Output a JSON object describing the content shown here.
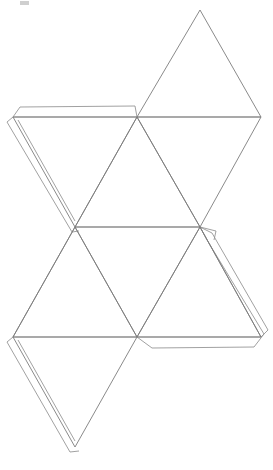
{
  "document": {
    "title": "Polyhedron Net",
    "kind": "geometric-net-diagram",
    "background_color": "#ffffff",
    "width": 273,
    "height": 470
  },
  "figure": {
    "name": "triangular-polyhedron-net",
    "line_color": "#7d7d7d",
    "fold_line_color": "#8d8d8d",
    "tab_line_color": "#909090",
    "face_fill_color": "#ffffff",
    "triangle_side_length": 124,
    "triangle_height": 110,
    "face_count": 8,
    "tab_count": 6
  },
  "geometry": {
    "vertices": {
      "apex_top": [
        200,
        10
      ],
      "band1_left": [
        13,
        117
      ],
      "band1_mid": [
        137,
        117
      ],
      "band1_right": [
        261,
        117
      ],
      "band2_left": [
        13,
        227
      ],
      "band2_mid": [
        75,
        227
      ],
      "band2_right": [
        200,
        227
      ],
      "band3_left": [
        13,
        337
      ],
      "band3_mid": [
        137,
        337
      ],
      "band3_right": [
        261,
        337
      ],
      "apex_bottom": [
        75,
        447
      ]
    },
    "faces": [
      {
        "name": "face-top-up",
        "points": "200,10 137,117 261,117",
        "orientation": "up"
      },
      {
        "name": "face-upper-left-down",
        "points": "13,117 137,117 75,227",
        "orientation": "down"
      },
      {
        "name": "face-upper-mid-down",
        "points": "137,117 261,117 200,227",
        "orientation": "down"
      },
      {
        "name": "face-mid-left-up",
        "points": "75,227 13,337 137,337",
        "orientation": "up"
      },
      {
        "name": "face-mid-right-up",
        "points": "200,227 137,337 261,337",
        "orientation": "up"
      },
      {
        "name": "face-mid-center-up",
        "points": "137,117 75,227 200,227",
        "orientation": "hidden"
      },
      {
        "name": "face-lower-down",
        "points": "13,337 137,337 75,447",
        "orientation": "down"
      },
      {
        "name": "face-right-down",
        "points": "200,227 261,337 137,337",
        "orientation": "down"
      }
    ],
    "tabs": [
      {
        "name": "tab-upper-left-top",
        "edge": "13,117 137,117"
      },
      {
        "name": "tab-upper-left-side",
        "edge": "13,117 75,227"
      },
      {
        "name": "tab-mid-left-side",
        "edge": "13,337 75,447"
      },
      {
        "name": "tab-bottom-left-side",
        "edge": "13,337 75,447"
      },
      {
        "name": "tab-right-upper-side",
        "edge": "200,227 261,337"
      },
      {
        "name": "tab-right-lower-edge",
        "edge": "137,337 261,337"
      }
    ]
  },
  "caption": {
    "line": "",
    "visible": false
  }
}
